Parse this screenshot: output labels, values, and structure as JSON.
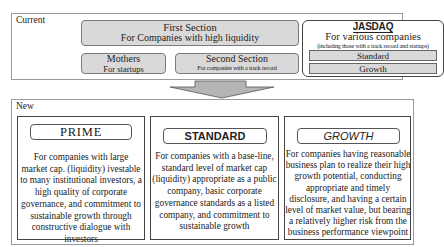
{
  "current": {
    "label": "Current",
    "first_section": {
      "title": "First Section",
      "subtitle": "For Companies with high liquidity"
    },
    "mothers": {
      "title": "Mothers",
      "subtitle": "For startups"
    },
    "second_section": {
      "title": "Second Section",
      "subtitle": "For companies with a track record"
    },
    "jasdaq": {
      "logo": "JASDAQ",
      "title": "For various companies",
      "subtitle": "(including those with a track record and startups)",
      "tiers": [
        "Standard",
        "Growth"
      ]
    }
  },
  "arrow": {
    "direction": "down",
    "color": "#b5b5b5"
  },
  "new": {
    "label": "New",
    "segments": [
      {
        "title": "PRIME",
        "description": "For companies with large market cap. (liquidity) ivestable to many institutional investors, a high quality of corporate governance, and commitment to sustainable growth through constructive dialogue with investors"
      },
      {
        "title": "STANDARD",
        "description": "For companies with a base-line, standard level of market cap (liquidity) appropriate as a public company, basic corporate governance standards as a listed company, and commitment to sustainable growth"
      },
      {
        "title": "GROWTH",
        "description": "For companies having reasonable business plan to realize their high growth potential, conducting appropriate and timely disclosure, and having a certain level of market value, but bearing a relatively higher risk from the business performance viewpoint"
      }
    ]
  }
}
